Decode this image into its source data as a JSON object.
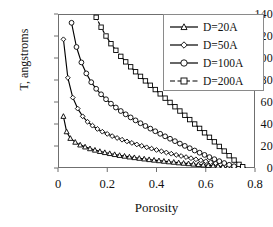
{
  "chart_data": {
    "type": "line",
    "title": "",
    "xlabel": "Porosity",
    "ylabel": "T, angstroms",
    "xlim": [
      0,
      0.8
    ],
    "ylim": [
      0,
      140
    ],
    "xticks": [
      "0",
      "0.2",
      "0.4",
      "0.6",
      "0.8"
    ],
    "xtick_values": [
      0,
      0.2,
      0.4,
      0.6,
      0.8
    ],
    "yticks": [
      "0",
      "20",
      "40",
      "60",
      "80",
      "100",
      "120",
      "140"
    ],
    "ytick_values": [
      0,
      20,
      40,
      60,
      80,
      100,
      120,
      140
    ],
    "grid": false,
    "legend_position": "top-right",
    "series": [
      {
        "name": "D=20A",
        "marker": "triangle",
        "linestyle": "solid",
        "color": "#000000",
        "x": [
          0.022,
          0.035,
          0.05,
          0.07,
          0.09,
          0.11,
          0.13,
          0.15,
          0.17,
          0.19,
          0.21,
          0.23,
          0.25,
          0.27,
          0.29,
          0.31,
          0.33,
          0.35,
          0.37,
          0.39,
          0.41,
          0.43,
          0.45,
          0.47,
          0.49,
          0.51,
          0.53,
          0.55,
          0.57,
          0.59,
          0.61,
          0.63,
          0.65,
          0.67,
          0.69,
          0.71,
          0.73,
          0.75
        ],
        "y": [
          47,
          33,
          27,
          23.5,
          21,
          19.2,
          17.6,
          16.3,
          15.1,
          14.1,
          13.2,
          12.3,
          11.5,
          10.8,
          10.1,
          9.5,
          8.9,
          8.3,
          7.7,
          7.2,
          6.7,
          6.2,
          5.7,
          5.3,
          4.8,
          4.4,
          4.0,
          3.6,
          3.2,
          2.8,
          2.4,
          2.0,
          1.7,
          1.3,
          1.0,
          0.7,
          0.4,
          0.2
        ]
      },
      {
        "name": "D=50A",
        "marker": "diamond",
        "linestyle": "solid",
        "color": "#000000",
        "x": [
          0.022,
          0.04,
          0.06,
          0.08,
          0.1,
          0.12,
          0.14,
          0.16,
          0.18,
          0.2,
          0.22,
          0.24,
          0.26,
          0.28,
          0.3,
          0.32,
          0.34,
          0.36,
          0.38,
          0.4,
          0.42,
          0.44,
          0.46,
          0.48,
          0.5,
          0.52,
          0.54,
          0.56,
          0.58,
          0.6,
          0.62,
          0.64,
          0.66,
          0.68,
          0.7,
          0.72,
          0.74,
          0.75
        ],
        "y": [
          117,
          82,
          64,
          54,
          47,
          42,
          38.5,
          35.5,
          33,
          31,
          29,
          27.3,
          25.7,
          24.2,
          22.8,
          21.4,
          20.1,
          18.8,
          17.6,
          16.4,
          15.2,
          14.1,
          13.0,
          11.9,
          10.9,
          9.9,
          8.9,
          7.9,
          7.0,
          6.1,
          5.2,
          4.3,
          3.4,
          2.6,
          1.8,
          1.1,
          0.5,
          0.2
        ]
      },
      {
        "name": "D=100A",
        "marker": "circle",
        "linestyle": "solid",
        "color": "#000000",
        "x": [
          0.055,
          0.075,
          0.095,
          0.115,
          0.135,
          0.155,
          0.175,
          0.195,
          0.215,
          0.235,
          0.255,
          0.275,
          0.295,
          0.315,
          0.335,
          0.355,
          0.375,
          0.395,
          0.415,
          0.435,
          0.455,
          0.475,
          0.495,
          0.515,
          0.535,
          0.555,
          0.575,
          0.595,
          0.615,
          0.635,
          0.655,
          0.675,
          0.695,
          0.715,
          0.735,
          0.75
        ],
        "y": [
          132,
          110,
          96,
          86,
          78,
          72,
          67,
          62.5,
          58.5,
          55,
          51.8,
          48.8,
          46,
          43.3,
          40.7,
          38.2,
          35.8,
          33.4,
          31.1,
          28.8,
          26.6,
          24.4,
          22.2,
          20.1,
          18.0,
          15.9,
          13.9,
          11.9,
          9.9,
          8.0,
          6.2,
          4.5,
          2.9,
          1.6,
          0.6,
          0.2
        ]
      },
      {
        "name": "D=200A",
        "marker": "square",
        "linestyle": "dashed",
        "color": "#000000",
        "x": [
          0.155,
          0.175,
          0.195,
          0.215,
          0.235,
          0.255,
          0.275,
          0.295,
          0.315,
          0.335,
          0.355,
          0.375,
          0.395,
          0.415,
          0.435,
          0.455,
          0.475,
          0.495,
          0.515,
          0.535,
          0.555,
          0.575,
          0.595,
          0.615,
          0.635,
          0.655,
          0.675,
          0.695,
          0.715,
          0.735,
          0.75
        ],
        "y": [
          137,
          128,
          120,
          113,
          107,
          101.5,
          96.5,
          92,
          87.5,
          83.3,
          79.2,
          75.2,
          71.3,
          67.4,
          63.5,
          59.6,
          55.7,
          51.8,
          47.9,
          44.0,
          40.0,
          36.0,
          32.0,
          27.9,
          23.8,
          19.6,
          15.4,
          11.2,
          7.2,
          3.3,
          1.2
        ]
      }
    ]
  }
}
